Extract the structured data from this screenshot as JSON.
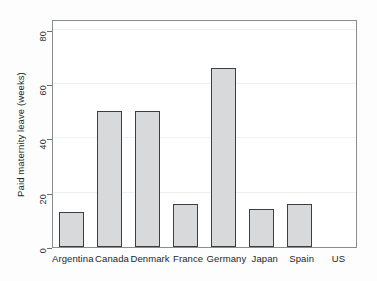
{
  "chart_data": {
    "type": "bar",
    "title": "",
    "xlabel": "",
    "ylabel": "Paid maternity leave (weeks)",
    "categories": [
      "Argentina",
      "Canada",
      "Denmark",
      "France",
      "Germany",
      "Japan",
      "Spain",
      "US"
    ],
    "values": [
      13,
      50,
      50,
      16,
      66,
      14,
      16,
      0
    ],
    "ylim": [
      0,
      84
    ],
    "yticks": [
      0,
      20,
      40,
      60,
      80
    ],
    "ytick_labels": [
      "0",
      "20",
      "40",
      "60",
      "80"
    ],
    "grid": true,
    "legend": null,
    "bar_fill_color": "#d8d9da",
    "bar_edge_color": "#3b3f43",
    "frame_color": "#8a8d90",
    "gridline_color": "#eef1f4",
    "background_color": "#ffffff"
  }
}
